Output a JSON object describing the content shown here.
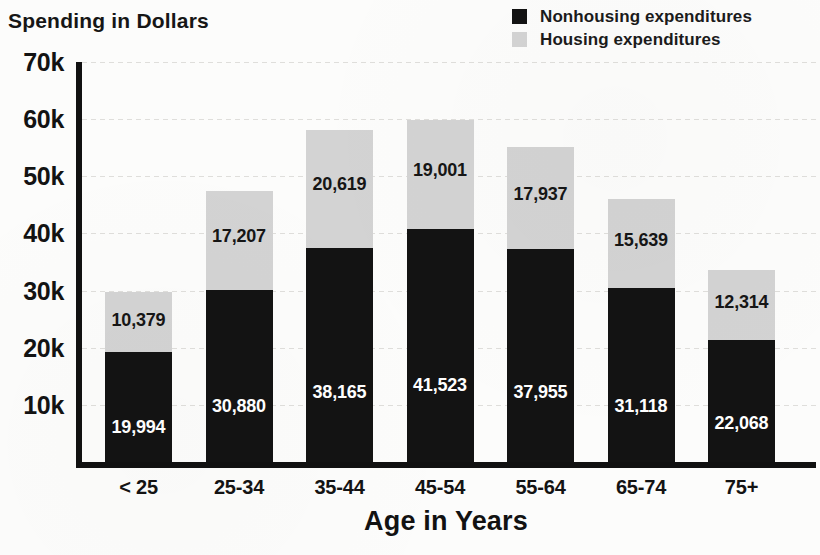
{
  "chart_data": {
    "type": "bar",
    "subtype": "stacked-bar",
    "title": "",
    "xlabel": "Age in Years",
    "ylabel": "Spending in Dollars",
    "categories": [
      "< 25",
      "25-34",
      "35-44",
      "45-54",
      "55-64",
      "65-74",
      "75+"
    ],
    "series": [
      {
        "name": "Nonhousing expenditures",
        "color": "#131313",
        "values": [
          19994,
          30880,
          38165,
          41523,
          37955,
          31118,
          22068
        ],
        "labels": [
          "19,994",
          "30,880",
          "38,165",
          "41,523",
          "37,955",
          "31,118",
          "22,068"
        ]
      },
      {
        "name": "Housing expenditures",
        "color": "#d3d3d3",
        "values": [
          10379,
          17207,
          20619,
          19001,
          17937,
          15639,
          12314
        ],
        "labels": [
          "10,379",
          "17,207",
          "20,619",
          "19,001",
          "17,937",
          "15,639",
          "12,314"
        ]
      }
    ],
    "totals": [
      30373,
      48087,
      58784,
      60524,
      55892,
      46757,
      34382
    ],
    "ylim": [
      0,
      70000
    ],
    "ytick_values": [
      70000,
      60000,
      50000,
      40000,
      30000,
      20000,
      10000
    ],
    "ytick_labels": [
      "70k",
      "60k",
      "50k",
      "40k",
      "30k",
      "20k",
      "10k"
    ],
    "grid": true,
    "legend_position": "top-right"
  },
  "axes": {
    "y_title": "Spending in Dollars",
    "x_title": "Age in Years"
  },
  "legend": {
    "items": [
      {
        "label": "Nonhousing expenditures",
        "swatch": "#131313"
      },
      {
        "label": "Housing expenditures",
        "swatch": "#d3d3d3"
      }
    ]
  }
}
